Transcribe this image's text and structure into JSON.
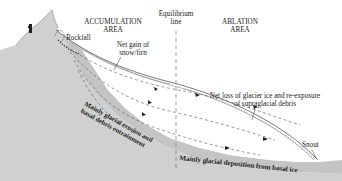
{
  "diagram": {
    "type": "glacier longitudinal cross-section",
    "labels": {
      "accumulation_area": [
        "ACCUMULATION",
        "AREA"
      ],
      "equilibrium_line": [
        "Equilibrium",
        "line"
      ],
      "ablation_area": [
        "ABLATION",
        "AREA"
      ],
      "rockfall": "Rockfall",
      "net_gain": [
        "Net gain of",
        "snow/firn"
      ],
      "net_loss": [
        "Net loss of glacier ice and re-exposure",
        "of supraglacial debris"
      ],
      "snout": "Snout",
      "basal_erosion": [
        "Mainly glacial erosion and",
        "basal debris entrainment"
      ],
      "basal_deposition": "Mainly glacial deposition from basal ice"
    },
    "colors": {
      "bedrock": "#cfcfcf",
      "bedrock_dark": "#b5b5b5",
      "basal_band": "#c8c8c8",
      "ice": "#ffffff",
      "line": "#333333",
      "text": "#222222"
    }
  }
}
